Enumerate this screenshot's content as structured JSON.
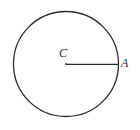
{
  "figure": {
    "kind": "circle-with-radius",
    "background_color": "#ffffff",
    "stroke_color": "#2b2b2b",
    "labels": {
      "center": "C",
      "endpoint": "A"
    },
    "circle": {
      "center_x": 66,
      "center_y": 64,
      "radius": 53
    },
    "radius_segment": {
      "x1": 66,
      "y1": 64,
      "x2": 119,
      "y2": 64
    }
  }
}
